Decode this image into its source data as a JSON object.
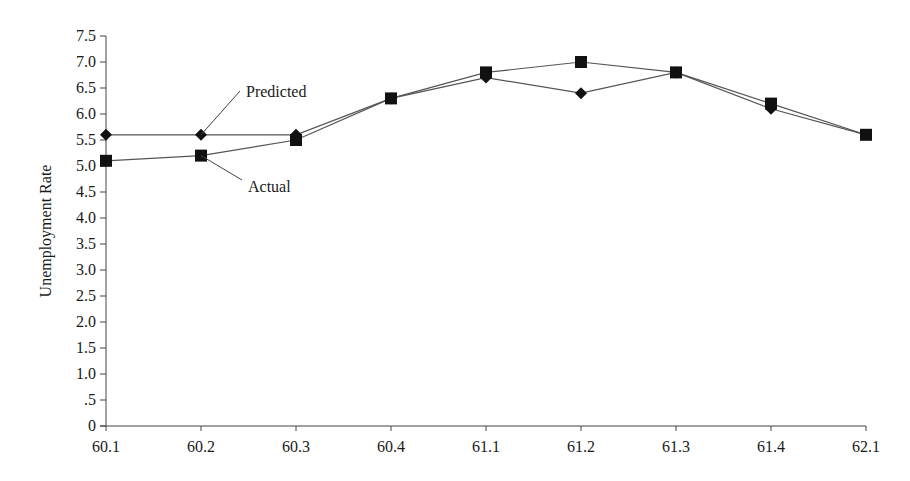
{
  "chart_data": {
    "type": "line",
    "title": "",
    "xlabel": "",
    "ylabel": "Unemployment Rate",
    "categories": [
      "60.1",
      "60.2",
      "60.3",
      "60.4",
      "61.1",
      "61.2",
      "61.3",
      "61.4",
      "62.1"
    ],
    "series": [
      {
        "name": "Predicted",
        "marker": "diamond",
        "values": [
          5.6,
          5.6,
          5.6,
          6.3,
          6.7,
          6.4,
          6.8,
          6.1,
          5.6
        ]
      },
      {
        "name": "Actual",
        "marker": "square",
        "values": [
          5.1,
          5.2,
          5.5,
          6.3,
          6.8,
          7.0,
          6.8,
          6.2,
          5.6
        ]
      }
    ],
    "ylim": [
      0,
      7.5
    ],
    "yticks": [
      0,
      0.5,
      1.0,
      1.5,
      2.0,
      2.5,
      3.0,
      3.5,
      4.0,
      4.5,
      5.0,
      5.5,
      6.0,
      6.5,
      7.0,
      7.5
    ],
    "ytick_labels": [
      "0",
      ".5",
      "1.0",
      "1.5",
      "2.0",
      "2.5",
      "3.0",
      "3.5",
      "4.0",
      "4.5",
      "5.0",
      "5.5",
      "6.0",
      "6.5",
      "7.0",
      "7.5"
    ],
    "grid": false,
    "legend": "none; series labeled by callout annotations",
    "annotations": [
      {
        "text": "Predicted",
        "series": "Predicted",
        "point_index": 1,
        "label_x": 246,
        "label_y": 97
      },
      {
        "text": "Actual",
        "series": "Actual",
        "point_index": 1,
        "label_x": 248,
        "label_y": 192
      }
    ]
  },
  "colors": {
    "line": "#555555",
    "marker": "#111111",
    "axis": "#444444",
    "text": "#1a1a1a",
    "background": "#ffffff"
  }
}
